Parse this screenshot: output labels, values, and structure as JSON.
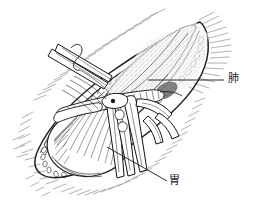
{
  "figure": {
    "type": "medical-illustration",
    "style": "pen-and-ink line drawing",
    "background_color": "#ffffff",
    "ink_color": "#1a1a1a"
  },
  "labels": [
    {
      "id": "lung",
      "text": "肺",
      "meaning": "lung",
      "leader": {
        "x1": 148,
        "y1": 80,
        "x2": 224,
        "y2": 80
      }
    },
    {
      "id": "stomach",
      "text": "胃",
      "meaning": "stomach",
      "leader": {
        "x1": 107,
        "y1": 147,
        "x2": 167,
        "y2": 181
      }
    }
  ],
  "structures": {
    "lung_label": "肺",
    "stomach_label": "胃"
  }
}
